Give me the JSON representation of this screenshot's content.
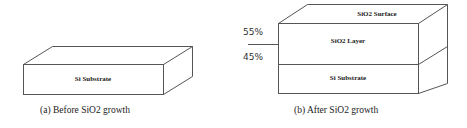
{
  "diagram_a": {
    "layer_label": "Si Substrate",
    "caption": "(a) Before SiO2 growth"
  },
  "diagram_b": {
    "surface_label": "SiO2 Surface",
    "layer_label": "SiO2 Layer",
    "substrate_label": "Si Substrate",
    "upper_percent": "55%",
    "lower_percent": "45%",
    "caption": "(b) After SiO2 growth"
  },
  "colors": {
    "stroke": "#555555",
    "text": "#222222"
  }
}
